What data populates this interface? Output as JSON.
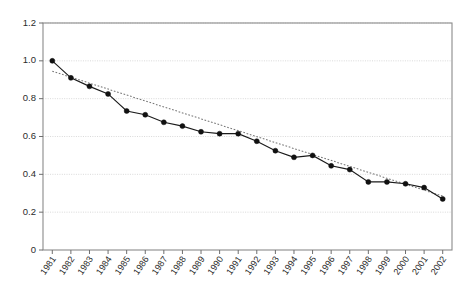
{
  "chart_data": {
    "type": "line",
    "title": "",
    "subtitle": "",
    "xlabel": "",
    "ylabel": "",
    "grid": true,
    "legend_position": "none",
    "ylim": [
      0,
      1.2
    ],
    "ytick_labels": [
      "1.2",
      "1.0",
      "0.8",
      "0.6",
      "0.4",
      "0.2",
      "0"
    ],
    "ytick_values": [
      1.2,
      1.0,
      0.8,
      0.6,
      0.4,
      0.2,
      0
    ],
    "categories": [
      "1981",
      "1982",
      "1983",
      "1984",
      "1985",
      "1986",
      "1987",
      "1988",
      "1989",
      "1990",
      "1991",
      "1992",
      "1993",
      "1994",
      "1995",
      "1996",
      "1997",
      "1998",
      "1999",
      "2000",
      "2001",
      "2002"
    ],
    "series": [
      {
        "name": "observed",
        "style": "solid-with-markers",
        "color": "#111111",
        "values": [
          1.0,
          0.91,
          0.865,
          0.825,
          0.735,
          0.715,
          0.675,
          0.655,
          0.625,
          0.615,
          0.615,
          0.575,
          0.525,
          0.49,
          0.5,
          0.445,
          0.425,
          0.36,
          0.36,
          0.35,
          0.33,
          0.27
        ]
      },
      {
        "name": "trend",
        "style": "dotted",
        "color": "#777777",
        "x_endpoints": [
          "1981",
          "2002"
        ],
        "y_endpoints": [
          0.945,
          0.285
        ]
      }
    ],
    "annotations": []
  },
  "axes": {
    "y_axis_name": "value-axis",
    "x_axis_name": "year-axis",
    "x_label_rotation_degrees": -55
  },
  "colors": {
    "grid": "#cfcfcf",
    "frame": "#8a8a8a",
    "data": "#111111",
    "trend": "#777777",
    "background": "#ffffff",
    "text": "#2b2b2b"
  }
}
